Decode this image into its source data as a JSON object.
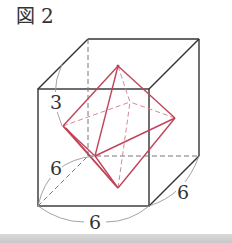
{
  "figure": {
    "caption_mark": "図",
    "caption_number": "2"
  },
  "diagram": {
    "labels": {
      "depth_arc_top": "3",
      "depth_arc_left": "6",
      "bottom_edge": "6",
      "right_depth": "6"
    },
    "colors": {
      "cube_edge": "#333333",
      "hidden_edge": "#777777",
      "octahedron": "#c0455a",
      "octahedron_hidden": "#d48a98",
      "arc": "#999999"
    }
  }
}
